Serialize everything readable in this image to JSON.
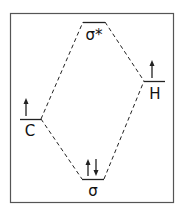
{
  "diagram": {
    "type": "molecular-orbital-energy-diagram",
    "levels": {
      "sigma_star": {
        "label": "σ*",
        "electrons": ""
      },
      "carbon": {
        "label": "C",
        "electrons": "↑"
      },
      "hydrogen": {
        "label": "H",
        "electrons": "↑"
      },
      "sigma": {
        "label": "σ",
        "electrons": "↑↓"
      }
    },
    "colors": {
      "line": "#222222",
      "frame": "#555555",
      "background": "#ffffff"
    }
  }
}
